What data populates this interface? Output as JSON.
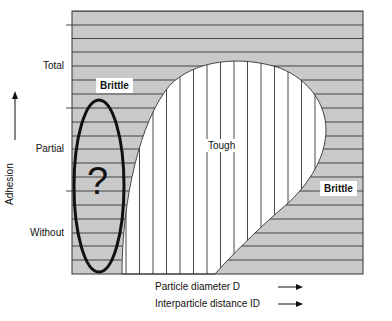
{
  "figure": {
    "y_axis": {
      "label": "Adhesion",
      "ticks": [
        "Total",
        "Partial",
        "Without"
      ]
    },
    "x_axis": {
      "labels": [
        "Particle diameter D",
        "Interparticle distance ID"
      ]
    },
    "regions": {
      "brittle_top_left": "Brittle",
      "tough_center": "Tough",
      "brittle_right": "Brittle"
    },
    "unknown_marker": "?",
    "colors": {
      "brittle_fill": "#c9c9c9",
      "tough_fill": "#ffffff",
      "line": "#333333",
      "ellipse": "#111111"
    }
  }
}
